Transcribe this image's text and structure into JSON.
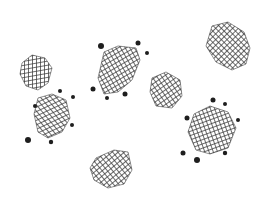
{
  "image": {
    "width": 269,
    "height": 206,
    "background": "#ffffff",
    "ink": "#3a3a3a",
    "dot_color": "#1e1e1e",
    "description": "Hand-drawn crosshatched irregular polygons, some surrounded by small black dots"
  },
  "shapes": [
    {
      "id": "blob-1",
      "points": "22,63 32,55 45,58 52,68 48,83 38,90 26,86 20,74",
      "hatch_angles": [
        80,
        0
      ],
      "dots": []
    },
    {
      "id": "blob-2",
      "points": "104,52 118,46 136,48 140,60 132,80 118,92 104,94 98,78",
      "hatch_angles": [
        60,
        -30
      ],
      "dots": [
        {
          "x": 101,
          "y": 46,
          "r": 3
        },
        {
          "x": 138,
          "y": 43,
          "r": 2.5
        },
        {
          "x": 147,
          "y": 53,
          "r": 2
        },
        {
          "x": 93,
          "y": 89,
          "r": 2.5
        },
        {
          "x": 107,
          "y": 98,
          "r": 2
        },
        {
          "x": 125,
          "y": 94,
          "r": 2.5
        }
      ]
    },
    {
      "id": "blob-3",
      "points": "38,98 52,94 66,100 70,118 62,132 48,138 38,132 34,114",
      "hatch_angles": [
        65,
        -40
      ],
      "dots": [
        {
          "x": 60,
          "y": 91,
          "r": 2
        },
        {
          "x": 73,
          "y": 97,
          "r": 2
        },
        {
          "x": 35,
          "y": 106,
          "r": 2
        },
        {
          "x": 72,
          "y": 125,
          "r": 2
        },
        {
          "x": 28,
          "y": 140,
          "r": 3
        },
        {
          "x": 51,
          "y": 142,
          "r": 2.2
        }
      ]
    },
    {
      "id": "blob-4",
      "points": "152,78 166,72 180,80 182,96 172,108 156,106 150,92",
      "hatch_angles": [
        55,
        -35
      ],
      "dots": []
    },
    {
      "id": "blob-5",
      "points": "212,26 228,22 244,32 250,48 246,64 232,70 216,62 206,46",
      "hatch_angles": [
        45,
        -45
      ],
      "dots": []
    },
    {
      "id": "blob-6",
      "points": "194,114 210,106 228,112 236,128 228,148 210,154 196,150 188,132",
      "hatch_angles": [
        70,
        -20
      ],
      "dots": [
        {
          "x": 213,
          "y": 100,
          "r": 2.5
        },
        {
          "x": 225,
          "y": 104,
          "r": 2
        },
        {
          "x": 187,
          "y": 118,
          "r": 2.5
        },
        {
          "x": 238,
          "y": 120,
          "r": 2
        },
        {
          "x": 183,
          "y": 153,
          "r": 2.5
        },
        {
          "x": 197,
          "y": 160,
          "r": 3
        },
        {
          "x": 225,
          "y": 153,
          "r": 2.2
        }
      ]
    },
    {
      "id": "blob-7",
      "points": "96,158 114,150 128,152 132,170 124,184 108,188 94,180 90,168",
      "hatch_angles": [
        50,
        -40
      ],
      "dots": []
    }
  ]
}
